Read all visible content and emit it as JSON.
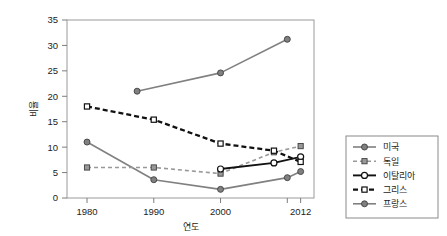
{
  "chart_data": {
    "type": "line",
    "title": "",
    "xlabel": "연도",
    "ylabel": "비율",
    "xlim": [
      1977,
      2014
    ],
    "ylim": [
      0,
      35
    ],
    "ytick_values": [
      0,
      5,
      10,
      15,
      20,
      25,
      30,
      35
    ],
    "ytick_labels": [
      "0",
      "5",
      "10",
      "15",
      "20",
      "25",
      "30",
      "35"
    ],
    "xtick_values": [
      1980,
      1990,
      2000,
      2010,
      2012
    ],
    "xtick_labels": [
      "1980",
      "1990",
      "2000",
      "",
      "2012"
    ],
    "grid": false,
    "legend_position": "right-outside",
    "series": [
      {
        "name": "미국",
        "color": "#808080",
        "linestyle": "solid",
        "marker": "filled-circle",
        "x": [
          1980,
          1990,
          2000,
          2010,
          2012
        ],
        "y": [
          11.0,
          3.6,
          1.7,
          4.0,
          5.2
        ]
      },
      {
        "name": "독일",
        "color": "#999999",
        "linestyle": "dashed",
        "marker": "filled-square",
        "x": [
          1980,
          1990,
          2000,
          2008,
          2012
        ],
        "y": [
          6.0,
          6.0,
          4.8,
          9.0,
          10.2
        ]
      },
      {
        "name": "이탈리아",
        "color": "#111111",
        "linestyle": "solid",
        "marker": "open-circle",
        "x": [
          2000,
          2008,
          2012
        ],
        "y": [
          5.7,
          6.9,
          8.1
        ]
      },
      {
        "name": "그리스",
        "color": "#111111",
        "linestyle": "dashed",
        "marker": "open-square",
        "x": [
          1980,
          1990,
          2000,
          2008,
          2012
        ],
        "y": [
          18.0,
          15.4,
          10.7,
          9.3,
          7.1
        ]
      },
      {
        "name": "프랑스",
        "color": "#808080",
        "linestyle": "solid",
        "marker": "filled-circle",
        "x": [
          1987.5,
          2000,
          2010
        ],
        "y": [
          21.0,
          24.6,
          31.2
        ]
      }
    ]
  },
  "legend": {
    "items": [
      {
        "label": "미국"
      },
      {
        "label": "독일"
      },
      {
        "label": "이탈리아"
      },
      {
        "label": "그리스"
      },
      {
        "label": "프랑스"
      }
    ]
  }
}
